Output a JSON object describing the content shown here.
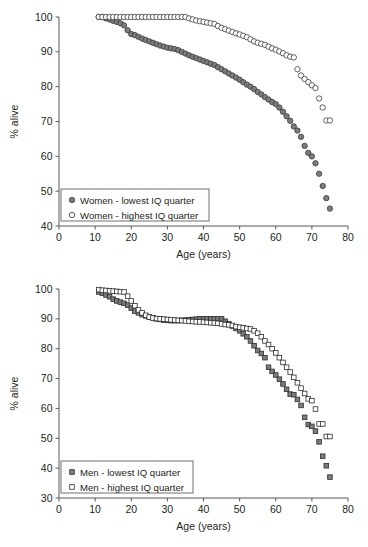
{
  "figure": {
    "panels": [
      "women",
      "men"
    ]
  },
  "chart_data": [
    {
      "id": "women",
      "type": "scatter",
      "title": "",
      "xlabel": "Age (years)",
      "ylabel": "% alive",
      "xlim": [
        0,
        80
      ],
      "ylim": [
        40,
        100
      ],
      "xticks": [
        0,
        10,
        20,
        30,
        40,
        50,
        60,
        70,
        80
      ],
      "yticks": [
        40,
        50,
        60,
        70,
        80,
        90,
        100
      ],
      "grid": false,
      "legend_position": "lower-left",
      "series": [
        {
          "name": "Women - lowest IQ quarter",
          "marker": "filled-circle",
          "color": "#7c7c7c",
          "edge_color": "#3a3a3a",
          "x": [
            11,
            12,
            13,
            14,
            15,
            16,
            17,
            18,
            19,
            20,
            21,
            22,
            23,
            24,
            25,
            26,
            27,
            28,
            29,
            30,
            31,
            32,
            33,
            34,
            35,
            36,
            37,
            38,
            39,
            40,
            41,
            42,
            43,
            44,
            45,
            46,
            47,
            48,
            49,
            50,
            51,
            52,
            53,
            54,
            55,
            56,
            57,
            58,
            59,
            60,
            61,
            62,
            63,
            64,
            65,
            66,
            67,
            68,
            69,
            70,
            71,
            72,
            73,
            74,
            75
          ],
          "y": [
            100,
            100,
            99.6,
            99.3,
            98.9,
            98.6,
            98.2,
            97.6,
            96.2,
            95.1,
            94.8,
            94.3,
            93.8,
            93.4,
            93.0,
            92.6,
            92.2,
            91.8,
            91.5,
            91.2,
            91.0,
            90.8,
            90.5,
            90.0,
            89.5,
            89.0,
            88.6,
            88.2,
            87.8,
            87.4,
            87.0,
            86.6,
            86.2,
            85.6,
            85.0,
            84.4,
            83.8,
            83.2,
            82.6,
            82.0,
            81.3,
            80.6,
            80.0,
            79.3,
            78.5,
            77.8,
            77.0,
            76.3,
            75.6,
            75.0,
            74.0,
            72.8,
            71.5,
            70.2,
            68.6,
            67.4,
            65.6,
            63.0,
            61.0,
            60.0,
            58.0,
            55.0,
            51.5,
            48.0,
            45.0
          ]
        },
        {
          "name": "Women - highest IQ quarter",
          "marker": "open-circle",
          "color": "#ffffff",
          "edge_color": "#3a3a3a",
          "x": [
            11,
            12,
            13,
            14,
            15,
            16,
            17,
            18,
            19,
            20,
            21,
            22,
            23,
            24,
            25,
            26,
            27,
            28,
            29,
            30,
            31,
            32,
            33,
            34,
            35,
            36,
            37,
            38,
            39,
            40,
            41,
            42,
            43,
            44,
            45,
            46,
            47,
            48,
            49,
            50,
            51,
            52,
            53,
            54,
            55,
            56,
            57,
            58,
            59,
            60,
            61,
            62,
            63,
            64,
            65,
            66,
            67,
            68,
            69,
            70,
            71,
            72,
            73,
            74,
            75
          ],
          "y": [
            100,
            100,
            100,
            100,
            100,
            100,
            100,
            100,
            100,
            100,
            100,
            100,
            100,
            100,
            100,
            100,
            100,
            100,
            100,
            100,
            100,
            100,
            100,
            100,
            100,
            99.6,
            99.3,
            99.0,
            98.8,
            98.6,
            98.4,
            98.2,
            98.0,
            97.4,
            96.9,
            96.5,
            96.1,
            95.7,
            95.3,
            95.0,
            94.6,
            94.2,
            93.6,
            93.0,
            92.6,
            92.3,
            92.0,
            91.5,
            91.0,
            90.6,
            90.1,
            89.6,
            89.0,
            88.6,
            88.4,
            85.0,
            83.2,
            82.2,
            81.3,
            80.4,
            79.6,
            76.6,
            74.0,
            70.3,
            70.3
          ]
        }
      ]
    },
    {
      "id": "men",
      "type": "scatter",
      "title": "",
      "xlabel": "Age (years)",
      "ylabel": "% alive",
      "xlim": [
        0,
        80
      ],
      "ylim": [
        30,
        100
      ],
      "xticks": [
        0,
        10,
        20,
        30,
        40,
        50,
        60,
        70,
        80
      ],
      "yticks": [
        30,
        40,
        50,
        60,
        70,
        80,
        90,
        100
      ],
      "grid": false,
      "legend_position": "lower-left",
      "series": [
        {
          "name": "Men - lowest IQ quarter",
          "marker": "filled-square",
          "color": "#7c7c7c",
          "edge_color": "#2f2f2f",
          "x": [
            11,
            12,
            13,
            14,
            15,
            16,
            17,
            18,
            19,
            20,
            21,
            22,
            23,
            24,
            25,
            26,
            27,
            28,
            29,
            30,
            31,
            32,
            33,
            34,
            35,
            36,
            37,
            38,
            39,
            40,
            41,
            42,
            43,
            44,
            45,
            46,
            47,
            48,
            49,
            50,
            51,
            52,
            53,
            54,
            55,
            56,
            57,
            58,
            59,
            60,
            61,
            62,
            63,
            64,
            65,
            66,
            67,
            68,
            69,
            70,
            71,
            72,
            73,
            74,
            75
          ],
          "y": [
            99.0,
            98.6,
            98.0,
            97.4,
            96.6,
            96.0,
            95.6,
            95.2,
            94.6,
            93.6,
            92.6,
            92.0,
            91.4,
            91.0,
            90.6,
            90.3,
            90.0,
            89.8,
            89.6,
            89.5,
            89.4,
            89.4,
            89.4,
            89.5,
            89.6,
            89.7,
            89.8,
            89.9,
            90.0,
            90.0,
            90.0,
            90.0,
            90.0,
            90.0,
            90.0,
            89.2,
            88.4,
            87.6,
            86.8,
            86.0,
            85.0,
            84.0,
            82.6,
            81.0,
            79.4,
            78.4,
            77.0,
            73.8,
            72.4,
            71.2,
            69.8,
            68.2,
            66.4,
            64.8,
            64.6,
            63.0,
            61.0,
            57.0,
            54.6,
            54.0,
            52.4,
            48.8,
            44.0,
            40.8,
            37.0
          ]
        },
        {
          "name": "Men - highest IQ quarter",
          "marker": "open-square",
          "color": "#ffffff",
          "edge_color": "#2f2f2f",
          "x": [
            11,
            12,
            13,
            14,
            15,
            16,
            17,
            18,
            19,
            20,
            21,
            22,
            23,
            24,
            25,
            26,
            27,
            28,
            29,
            30,
            31,
            32,
            33,
            34,
            35,
            36,
            37,
            38,
            39,
            40,
            41,
            42,
            43,
            44,
            45,
            46,
            47,
            48,
            49,
            50,
            51,
            52,
            53,
            54,
            55,
            56,
            57,
            58,
            59,
            60,
            61,
            62,
            63,
            64,
            65,
            66,
            67,
            68,
            69,
            70,
            71,
            72,
            73,
            74,
            75
          ],
          "y": [
            99.8,
            99.6,
            99.5,
            99.4,
            99.3,
            99.2,
            99.1,
            99.0,
            97.6,
            96.0,
            94.4,
            93.0,
            92.0,
            91.2,
            90.6,
            90.3,
            90.1,
            90.0,
            89.9,
            89.8,
            89.7,
            89.6,
            89.5,
            89.4,
            89.3,
            89.2,
            89.1,
            89.0,
            89.0,
            88.9,
            88.8,
            88.7,
            88.6,
            88.5,
            88.3,
            88.1,
            88.0,
            87.8,
            87.4,
            87.2,
            87.0,
            86.8,
            86.6,
            86.0,
            85.2,
            84.0,
            82.6,
            81.4,
            80.0,
            78.6,
            77.0,
            75.4,
            73.8,
            72.2,
            70.4,
            68.6,
            66.8,
            65.0,
            63.2,
            62.6,
            59.8,
            54.8,
            54.8,
            50.6,
            50.6
          ]
        }
      ]
    }
  ],
  "panels": {
    "women": {
      "ylabel": "% alive",
      "xlabel": "Age (years)",
      "xticks": [
        "0",
        "10",
        "20",
        "30",
        "40",
        "50",
        "60",
        "70",
        "80"
      ],
      "yticks": [
        "40",
        "50",
        "60",
        "70",
        "80",
        "90",
        "100"
      ],
      "legend": [
        {
          "label": "Women - lowest IQ quarter",
          "marker": "filled-circle"
        },
        {
          "label": "Women - highest IQ quarter",
          "marker": "open-circle"
        }
      ]
    },
    "men": {
      "ylabel": "% alive",
      "xlabel": "Age (years)",
      "xticks": [
        "0",
        "10",
        "20",
        "30",
        "40",
        "50",
        "60",
        "70",
        "80"
      ],
      "yticks": [
        "30",
        "40",
        "50",
        "60",
        "70",
        "80",
        "90",
        "100"
      ],
      "legend": [
        {
          "label": "Men - lowest IQ quarter",
          "marker": "filled-square"
        },
        {
          "label": "Men - highest IQ quarter",
          "marker": "open-square"
        }
      ]
    }
  }
}
